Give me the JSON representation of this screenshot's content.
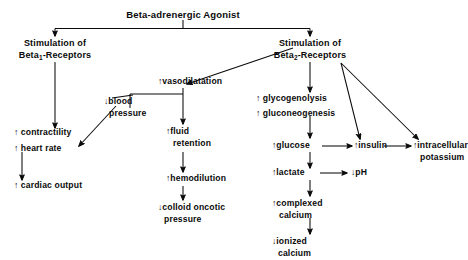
{
  "diagram": {
    "title": "Beta-adrenergic Agonist",
    "branches": {
      "left_header_line1": "Stimulation of",
      "left_header_line2_pre": "Beta",
      "left_header_line2_sub": "1",
      "left_header_line2_post": "-Receptors",
      "right_header_line1": "Stimulation of",
      "right_header_line2_pre": "Beta",
      "right_header_line2_sub": "2",
      "right_header_line2_post": "-Receptors"
    },
    "nodes": {
      "contractility": {
        "arrow": "↑",
        "line1": "contractility"
      },
      "heart_rate": {
        "arrow": "↑",
        "line1": "heart rate"
      },
      "cardiac_output": {
        "arrow": "↑",
        "line1": "cardiac output"
      },
      "vasodilatation": {
        "arrow": "↑",
        "line1": "vasodilatation"
      },
      "blood_pressure": {
        "arrow": "↓",
        "line1": "blood",
        "line2": "pressure"
      },
      "fluid_retention": {
        "arrow": "↑",
        "line1": "fluid",
        "line2": "retention"
      },
      "hemodilution": {
        "arrow": "↑",
        "line1": "hemodilution"
      },
      "colloid_oncotic_pressure": {
        "arrow": "↓",
        "line1": "colloid oncotic",
        "line2": "pressure"
      },
      "glycogenolysis": {
        "arrow": "↑",
        "line1": "glycogenolysis"
      },
      "gluconeogenesis": {
        "arrow": "↑",
        "line1": "gluconeogenesis"
      },
      "glucose": {
        "arrow": "↑",
        "line1": "glucose"
      },
      "insulin": {
        "arrow": "↑",
        "line1": "insulin"
      },
      "intracellular_potassium": {
        "arrow": "↑",
        "line1": "intracellular",
        "line2": "potassium"
      },
      "lactate": {
        "arrow": "↑",
        "line1": "lactate"
      },
      "ph": {
        "arrow": "↓",
        "line1": "pH"
      },
      "complexed_calcium": {
        "arrow": "↑",
        "line1": "complexed",
        "line2": "calcium"
      },
      "ionized_calcium": {
        "arrow": "↓",
        "line1": "ionized",
        "line2": "calcium"
      }
    },
    "colors": {
      "ink": "#0a0a0a",
      "background": "#ffffff"
    }
  }
}
